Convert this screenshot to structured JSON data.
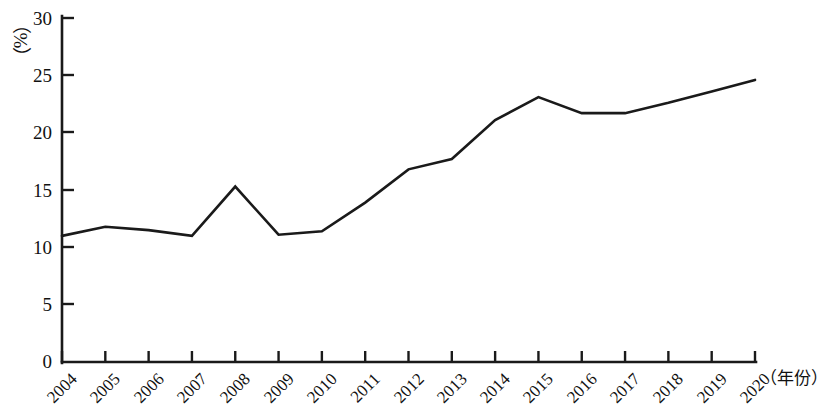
{
  "chart_data": {
    "type": "line",
    "title": "",
    "subtitle": "",
    "xlabel": "（年份）",
    "ylabel": "（%）",
    "x": [
      2004,
      2005,
      2006,
      2007,
      2008,
      2009,
      2010,
      2011,
      2012,
      2013,
      2014,
      2015,
      2016,
      2017,
      2018,
      2019,
      2020
    ],
    "categories": [
      "2004",
      "2005",
      "2006",
      "2007",
      "2008",
      "2009",
      "2010",
      "2011",
      "2012",
      "2013",
      "2014",
      "2015",
      "2016",
      "2017",
      "2018",
      "2019",
      "2020"
    ],
    "values": [
      11.0,
      11.8,
      11.5,
      11.0,
      15.3,
      11.1,
      11.4,
      13.9,
      16.8,
      17.7,
      21.1,
      23.1,
      21.7,
      21.7,
      22.6,
      23.6,
      24.6
    ],
    "series": [
      {
        "name": "",
        "values": [
          11.0,
          11.8,
          11.5,
          11.0,
          15.3,
          11.1,
          11.4,
          13.9,
          16.8,
          17.7,
          21.1,
          23.1,
          21.7,
          21.7,
          22.6,
          23.6,
          24.6
        ]
      }
    ],
    "ylim": [
      0,
      30
    ],
    "yticks": [
      0,
      5,
      10,
      15,
      20,
      25,
      30
    ],
    "ytick_labels": [
      "0",
      "5",
      "10",
      "15",
      "20",
      "25",
      "30"
    ],
    "xtick_labels": [
      "2004",
      "2005",
      "2006",
      "2007",
      "2008",
      "2009",
      "2010",
      "2011",
      "2012",
      "2013",
      "2014",
      "2015",
      "2016",
      "2017",
      "2018",
      "2019",
      "2020"
    ],
    "grid": false,
    "legend": null,
    "legend_position": "none",
    "annotations": [],
    "line_color": "#1a1a1a",
    "axis_color": "#1a1a1a"
  }
}
